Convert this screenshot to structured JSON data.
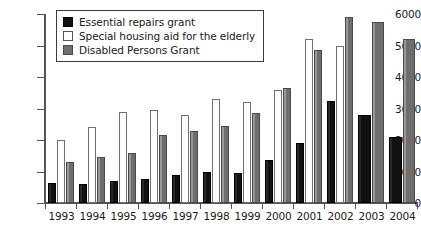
{
  "chart_data": {
    "type": "bar",
    "title": "",
    "subtitle": "",
    "xlabel": "",
    "ylabel": "",
    "ylim": [
      0,
      6000
    ],
    "ytick_step": 1000,
    "yticks": [
      0,
      1000,
      2000,
      3000,
      4000,
      5000,
      6000
    ],
    "ytick_labels": [
      "0",
      "1000",
      "2000",
      "3000",
      "4000",
      "5000",
      "6000"
    ],
    "grid": false,
    "legend_position": "top-left",
    "categories": [
      "1993",
      "1994",
      "1995",
      "1996",
      "1997",
      "1998",
      "1999",
      "2000",
      "2001",
      "2002",
      "2003",
      "2004"
    ],
    "series": [
      {
        "name": "Essential repairs grant",
        "color": "#111111",
        "values": [
          650,
          600,
          700,
          750,
          900,
          1000,
          950,
          1350,
          1900,
          3250,
          2800,
          2100
        ]
      },
      {
        "name": "Special housing aid for the elderly",
        "color": "#ffffff",
        "values": [
          2000,
          2400,
          2900,
          2950,
          2800,
          3300,
          3200,
          3600,
          5200,
          5000,
          null,
          null
        ]
      },
      {
        "name": "Disabled Persons Grant",
        "color": "#6e6e6e",
        "values": [
          1300,
          1450,
          1600,
          2150,
          2300,
          2450,
          2850,
          3650,
          4850,
          5900,
          5750,
          5200
        ]
      }
    ]
  },
  "legend": {
    "items": [
      {
        "label": "Essential repairs grant"
      },
      {
        "label": "Special housing aid for the elderly"
      },
      {
        "label": "Disabled Persons Grant"
      }
    ]
  }
}
